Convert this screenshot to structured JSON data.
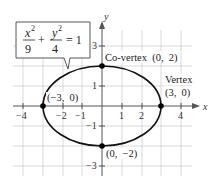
{
  "diagram": {
    "type": "ellipse-graph",
    "equation": {
      "x_num": "x",
      "x_exp": "2",
      "x_den": "9",
      "plus": "+",
      "y_num": "y",
      "y_exp": "2",
      "y_den": "4",
      "equals": "= 1"
    },
    "axes": {
      "x_label": "x",
      "y_label": "y",
      "x_ticks": [
        {
          "value": -4,
          "label": "−4"
        },
        {
          "value": -2,
          "label": "−2"
        },
        {
          "value": -1,
          "label": "−1"
        },
        {
          "value": 1,
          "label": "1"
        },
        {
          "value": 2,
          "label": "2"
        },
        {
          "value": 4,
          "label": "4"
        }
      ],
      "y_ticks": [
        {
          "value": 3,
          "label": "3"
        },
        {
          "value": 1,
          "label": "1"
        },
        {
          "value": -1,
          "label": "−1"
        },
        {
          "value": -3,
          "label": "−3"
        }
      ],
      "x_range": [
        -4.5,
        4.5
      ],
      "y_range": [
        -3.5,
        3.8
      ],
      "grid": true
    },
    "ellipse": {
      "a": 3,
      "b": 2,
      "center": [
        0,
        0
      ]
    },
    "points": [
      {
        "x": 0,
        "y": 2,
        "label": "Co-vertex  (0,  2)"
      },
      {
        "x": 3,
        "y": 0,
        "label_line1": "Vertex",
        "label_line2": "(3,  0)"
      },
      {
        "x": -3,
        "y": 0,
        "label": "(−3,  0)"
      },
      {
        "x": 0,
        "y": -2,
        "label": "(0,  −2)"
      }
    ],
    "colors": {
      "grid": "#c8c8c8",
      "axis": "#555555",
      "curve": "#111111",
      "point": "#000000"
    }
  }
}
